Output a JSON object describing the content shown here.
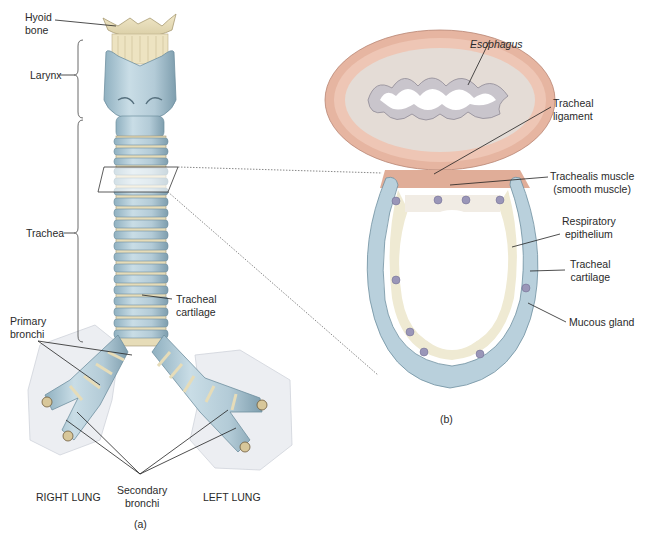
{
  "figure": {
    "panel_a": {
      "caption": "(a)",
      "labels": {
        "hyoid_bone": [
          "Hyoid",
          "bone"
        ],
        "larynx": "Larynx",
        "trachea": "Trachea",
        "tracheal_cartilage": [
          "Tracheal",
          "cartilage"
        ],
        "primary_bronchi": [
          "Primary",
          "bronchi"
        ],
        "secondary_bronchi": [
          "Secondary",
          "bronchi"
        ],
        "right_lung": "RIGHT LUNG",
        "left_lung": "LEFT LUNG"
      }
    },
    "panel_b": {
      "caption": "(b)",
      "labels": {
        "esophagus": "Esophagus",
        "tracheal_ligament": [
          "Tracheal",
          "ligament"
        ],
        "trachealis_muscle": [
          "Trachealis muscle",
          "(smooth muscle)"
        ],
        "respiratory_epithelium": [
          "Respiratory",
          "epithelium"
        ],
        "tracheal_cartilage": [
          "Tracheal",
          "cartilage"
        ],
        "mucous_gland": "Mucous gland"
      }
    },
    "colors": {
      "cartilage_blue": "#b9d0dc",
      "cartilage_edge": "#6f8f9f",
      "ligament_tan": "#e6dcb8",
      "muscle_pink": "#e0ad98",
      "esophagus_lining": "#c9c5cc",
      "gland_purple": "#9a96b8",
      "lung_tissue": "#e9eaee"
    }
  }
}
